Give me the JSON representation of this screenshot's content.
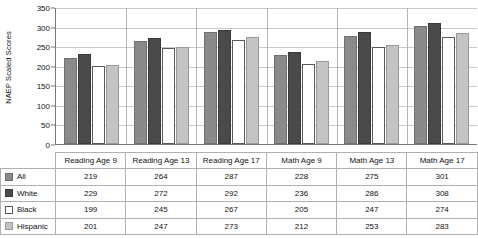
{
  "chart_data": {
    "type": "bar",
    "title": "",
    "xlabel": "",
    "ylabel": "NAEP Scaled Scores",
    "ylim": [
      0,
      350
    ],
    "yticks": [
      0,
      50,
      100,
      150,
      200,
      250,
      300,
      350
    ],
    "grid": true,
    "legend_position": "table-left-column",
    "categories": [
      "Reading Age 9",
      "Reading Age 13",
      "Reading Age 17",
      "Math Age 9",
      "Math Age 13",
      "Math Age 17"
    ],
    "series": [
      {
        "name": "All",
        "color": "#8a8a8a",
        "values": [
          219,
          264,
          287,
          228,
          275,
          301
        ]
      },
      {
        "name": "White",
        "color": "#4a4a4a",
        "values": [
          229,
          272,
          292,
          236,
          286,
          308
        ]
      },
      {
        "name": "Black",
        "color": "#ffffff",
        "values": [
          199,
          245,
          267,
          205,
          247,
          274
        ]
      },
      {
        "name": "Hispanic",
        "color": "#c4c4c4",
        "values": [
          201,
          247,
          273,
          212,
          253,
          283
        ]
      }
    ]
  },
  "table": {
    "corner_label": "",
    "column_headers": [
      "Reading Age 9",
      "Reading Age 13",
      "Reading Age 17",
      "Math Age 9",
      "Math Age 13",
      "Math Age 17"
    ],
    "rows": [
      {
        "label": "All",
        "values": [
          "219",
          "264",
          "287",
          "228",
          "275",
          "301"
        ]
      },
      {
        "label": "White",
        "values": [
          "229",
          "272",
          "292",
          "236",
          "286",
          "308"
        ]
      },
      {
        "label": "Black",
        "values": [
          "199",
          "245",
          "267",
          "205",
          "247",
          "274"
        ]
      },
      {
        "label": "Hispanic",
        "values": [
          "201",
          "247",
          "273",
          "212",
          "253",
          "283"
        ]
      }
    ]
  },
  "axis": {
    "y_title": "NAEP Scaled Scores",
    "y_tick_labels": [
      "350",
      "300",
      "250",
      "200",
      "150",
      "100",
      "50",
      "0"
    ]
  }
}
